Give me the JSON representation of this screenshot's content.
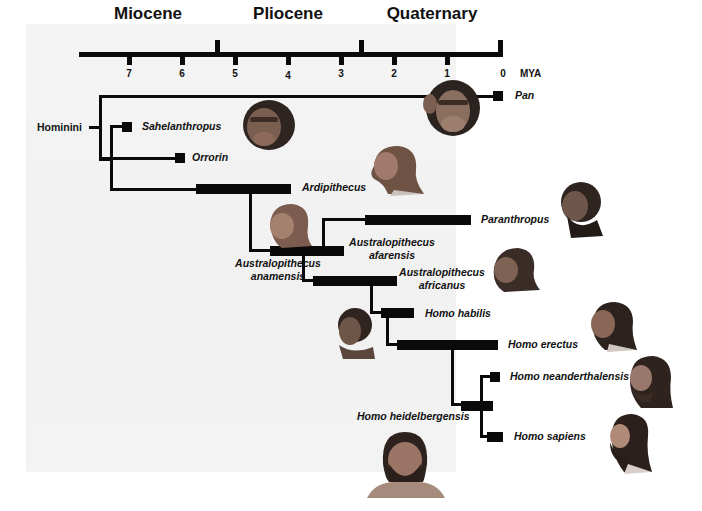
{
  "timescale": {
    "unit_label": "MYA",
    "epochs": [
      {
        "name": "Miocene",
        "x": 148
      },
      {
        "name": "Pliocene",
        "x": 288
      },
      {
        "name": "Quaternary",
        "x": 432
      }
    ],
    "ticks": [
      {
        "label": "7",
        "x": 129
      },
      {
        "label": "6",
        "x": 182
      },
      {
        "label": "5",
        "x": 235
      },
      {
        "label": "4",
        "x": 288
      },
      {
        "label": "3",
        "x": 341
      },
      {
        "label": "2",
        "x": 394
      },
      {
        "label": "1",
        "x": 447
      },
      {
        "label": "0",
        "x": 500
      }
    ]
  },
  "root_label": "Hominini",
  "taxa": {
    "pan": "Pan",
    "sahelanthropus": "Sahelanthropus",
    "orrorin": "Orrorin",
    "ardipithecus": "Ardipithecus",
    "paranthropus": "Paranthropus",
    "afarensis_1": "Australopithecus",
    "afarensis_2": "afarensis",
    "anamensis_1": "Australopithecus",
    "anamensis_2": "anamensis",
    "africanus_1": "Australopithecus",
    "africanus_2": "africanus",
    "habilis": "Homo habilis",
    "erectus": "Homo erectus",
    "neanderthalensis": "Homo neanderthalensis",
    "heidelbergensis": "Homo heidelbergensis",
    "sapiens": "Homo sapiens"
  },
  "colors": {
    "ink": "#0a0a0a",
    "panel": "#f2f2f2",
    "skin_ape": "#6b5446",
    "skin_hominin": "#9a7566",
    "hair": "#3a2a24"
  }
}
